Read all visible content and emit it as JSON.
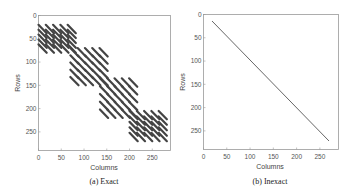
{
  "chart_data": [
    {
      "type": "scatter",
      "title": "",
      "caption": "(a) Exact",
      "xlabel": "Columns",
      "ylabel": "Rows",
      "xticks": [
        "0",
        "50",
        "100",
        "150",
        "200",
        "250"
      ],
      "yticks": [
        "0",
        "50",
        "100",
        "150",
        "200",
        "250"
      ],
      "xlim": [
        0,
        290
      ],
      "ylim": [
        290,
        0
      ],
      "description": "Sparsity pattern with 4 overlapping diagonal blocks of striped nonzeros",
      "blocks": [
        {
          "cols": [
            0,
            80
          ],
          "rows": [
            20,
            80
          ]
        },
        {
          "cols": [
            70,
            150
          ],
          "rows": [
            70,
            150
          ]
        },
        {
          "cols": [
            135,
            220
          ],
          "rows": [
            135,
            220
          ]
        },
        {
          "cols": [
            200,
            290
          ],
          "rows": [
            205,
            270
          ]
        }
      ]
    },
    {
      "type": "line",
      "title": "",
      "caption": "(b) Inexact",
      "xlabel": "Columns",
      "ylabel": "Rows",
      "xticks": [
        "0",
        "50",
        "100",
        "150",
        "200",
        "250"
      ],
      "yticks": [
        "0",
        "50",
        "100",
        "150",
        "200",
        "250"
      ],
      "xlim": [
        0,
        290
      ],
      "ylim": [
        290,
        0
      ],
      "description": "Single diagonal sparsity pattern",
      "line": {
        "x": [
          20,
          270
        ],
        "y": [
          20,
          270
        ]
      }
    }
  ],
  "left": {
    "caption": "(a) Exact",
    "xlabel": "Columns",
    "ylabel": "Rows"
  },
  "right": {
    "caption": "(b) Inexact",
    "xlabel": "Columns",
    "ylabel": "Rows"
  },
  "ticks": [
    "0",
    "50",
    "100",
    "150",
    "200",
    "250"
  ]
}
